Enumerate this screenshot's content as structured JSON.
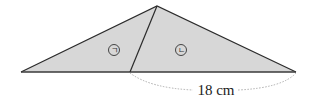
{
  "diagram": {
    "fill_color": "#d7d7d7",
    "stroke_color": "#2b2b2b",
    "dash_color": "#9a9a9a",
    "regions": [
      {
        "id": "giyeok",
        "label": "ㄱ"
      },
      {
        "id": "nieun",
        "label": "ㄴ"
      }
    ],
    "measurement": {
      "label": "18 cm"
    }
  }
}
